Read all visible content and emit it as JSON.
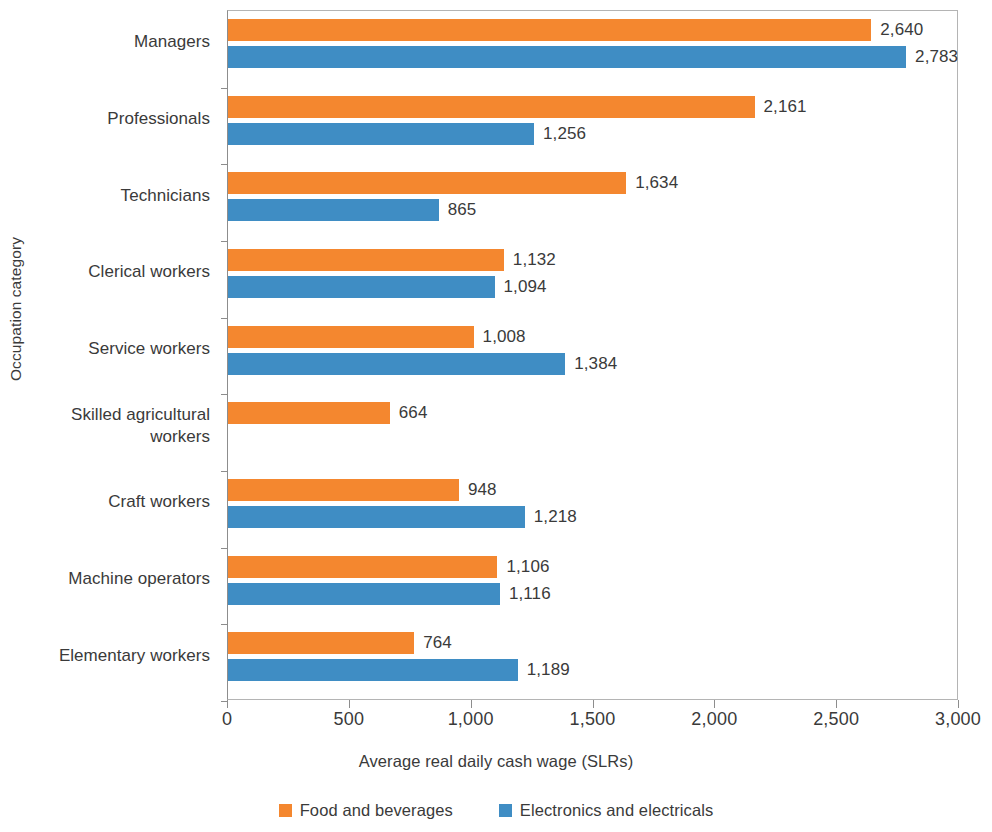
{
  "chart_data": {
    "type": "bar",
    "orientation": "horizontal",
    "title": "",
    "xlabel": "Average real daily cash wage (SLRs)",
    "ylabel": "Occupation category",
    "xlim": [
      0,
      3000
    ],
    "xticks": [
      0,
      500,
      1000,
      1500,
      2000,
      2500,
      3000
    ],
    "xtick_labels": [
      "0",
      "500",
      "1,000",
      "1,500",
      "2,000",
      "2,500",
      "3,000"
    ],
    "grid": false,
    "legend_position": "bottom",
    "categories": [
      "Managers",
      "Professionals",
      "Technicians",
      "Clerical workers",
      "Service workers",
      "Skilled agricultural workers",
      "Craft workers",
      "Machine operators",
      "Elementary workers"
    ],
    "series": [
      {
        "name": "Food and beverages",
        "color": "#f4872f",
        "values": [
          2640,
          2161,
          1634,
          1132,
          1008,
          664,
          948,
          1106,
          764
        ],
        "value_labels": [
          "2,640",
          "2,161",
          "1,634",
          "1,132",
          "1,008",
          "664",
          "948",
          "1,106",
          "764"
        ]
      },
      {
        "name": "Electronics and electricals",
        "color": "#3f8dc4",
        "values": [
          2783,
          1256,
          865,
          1094,
          1384,
          null,
          1218,
          1116,
          1189
        ],
        "value_labels": [
          "2,783",
          "1,256",
          "865",
          "1,094",
          "1,384",
          "",
          "1,218",
          "1,116",
          "1,189"
        ]
      }
    ]
  },
  "category_label_lines": [
    [
      "Managers"
    ],
    [
      "Professionals"
    ],
    [
      "Technicians"
    ],
    [
      "Clerical workers"
    ],
    [
      "Service workers"
    ],
    [
      "Skilled agricultural",
      "workers"
    ],
    [
      "Craft workers"
    ],
    [
      "Machine operators"
    ],
    [
      "Elementary workers"
    ]
  ]
}
